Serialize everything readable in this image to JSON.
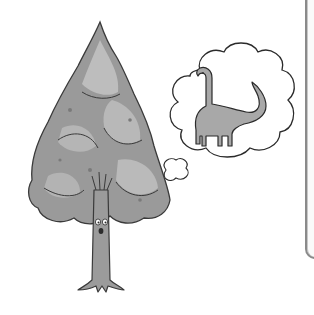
{
  "illustration": {
    "subject": "tree thinking of a dinosaur",
    "top_text_fragment": "",
    "elements": {
      "tree": {
        "label": "tree-with-face",
        "foliage_color": "#9a9a9a",
        "foliage_light": "#bdbdbd",
        "foliage_dark": "#7a7a7a",
        "trunk_color": "#9b9b9b"
      },
      "thought_bubble": {
        "label": "thought-bubble",
        "fill": "#ffffff",
        "stroke": "#2b2b2b"
      },
      "dinosaur": {
        "label": "brontosaurus",
        "fill": "#a8a8a8",
        "stroke": "#2b2b2b"
      }
    }
  },
  "frame": {
    "border_color": "#8a8a8a"
  }
}
